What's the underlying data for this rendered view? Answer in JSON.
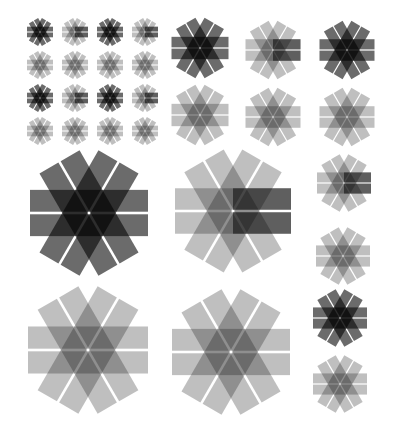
{
  "colors": {
    "background": "#ffffff",
    "ink": "#000000",
    "dark_opacity": 0.58,
    "light_opacity": 0.25,
    "accent_opacity": 0.5
  },
  "geometry": {
    "thickness_ratio": 0.185,
    "gap_ratio": 0.022,
    "angles": [
      0,
      60,
      -60
    ]
  },
  "rosettes": [
    {
      "id": "small-r1c1",
      "cx": 40,
      "cy": 32,
      "size": 26,
      "style": "dark"
    },
    {
      "id": "small-r1c2",
      "cx": 75,
      "cy": 32,
      "size": 26,
      "style": "half"
    },
    {
      "id": "small-r1c3",
      "cx": 110,
      "cy": 32,
      "size": 26,
      "style": "dark"
    },
    {
      "id": "small-r1c4",
      "cx": 145,
      "cy": 32,
      "size": 26,
      "style": "half"
    },
    {
      "id": "small-r2c1",
      "cx": 40,
      "cy": 65,
      "size": 26,
      "style": "light"
    },
    {
      "id": "small-r2c2",
      "cx": 75,
      "cy": 65,
      "size": 26,
      "style": "light"
    },
    {
      "id": "small-r2c3",
      "cx": 110,
      "cy": 65,
      "size": 26,
      "style": "light"
    },
    {
      "id": "small-r2c4",
      "cx": 145,
      "cy": 65,
      "size": 26,
      "style": "light"
    },
    {
      "id": "small-r3c1",
      "cx": 40,
      "cy": 98,
      "size": 26,
      "style": "dark"
    },
    {
      "id": "small-r3c2",
      "cx": 75,
      "cy": 98,
      "size": 26,
      "style": "half"
    },
    {
      "id": "small-r3c3",
      "cx": 110,
      "cy": 98,
      "size": 26,
      "style": "dark"
    },
    {
      "id": "small-r3c4",
      "cx": 145,
      "cy": 98,
      "size": 26,
      "style": "half"
    },
    {
      "id": "small-r4c1",
      "cx": 40,
      "cy": 131,
      "size": 26,
      "style": "light"
    },
    {
      "id": "small-r4c2",
      "cx": 75,
      "cy": 131,
      "size": 26,
      "style": "light"
    },
    {
      "id": "small-r4c3",
      "cx": 110,
      "cy": 131,
      "size": 26,
      "style": "light"
    },
    {
      "id": "small-r4c4",
      "cx": 145,
      "cy": 131,
      "size": 26,
      "style": "light"
    },
    {
      "id": "medium-r1c1",
      "cx": 200,
      "cy": 48,
      "size": 57,
      "style": "dark"
    },
    {
      "id": "medium-r1c2",
      "cx": 273,
      "cy": 50,
      "size": 55,
      "style": "half"
    },
    {
      "id": "medium-r1c3",
      "cx": 347,
      "cy": 50,
      "size": 55,
      "style": "dark"
    },
    {
      "id": "medium-r2c1",
      "cx": 200,
      "cy": 115,
      "size": 57,
      "style": "light"
    },
    {
      "id": "medium-r2c2",
      "cx": 273,
      "cy": 117,
      "size": 55,
      "style": "light"
    },
    {
      "id": "medium-r2c3",
      "cx": 347,
      "cy": 117,
      "size": 55,
      "style": "light"
    },
    {
      "id": "large-r1c1",
      "cx": 89,
      "cy": 213,
      "size": 118,
      "style": "dark"
    },
    {
      "id": "large-r1c2",
      "cx": 233,
      "cy": 211,
      "size": 116,
      "style": "half"
    },
    {
      "id": "large-r2c1",
      "cx": 88,
      "cy": 350,
      "size": 120,
      "style": "light"
    },
    {
      "id": "large-r2c2",
      "cx": 231,
      "cy": 352,
      "size": 118,
      "style": "light"
    },
    {
      "id": "side-1",
      "cx": 344,
      "cy": 183,
      "size": 54,
      "style": "half"
    },
    {
      "id": "side-2",
      "cx": 343,
      "cy": 256,
      "size": 54,
      "style": "light"
    },
    {
      "id": "side-3",
      "cx": 340,
      "cy": 318,
      "size": 54,
      "style": "dark"
    },
    {
      "id": "side-4",
      "cx": 340,
      "cy": 384,
      "size": 54,
      "style": "light"
    }
  ]
}
